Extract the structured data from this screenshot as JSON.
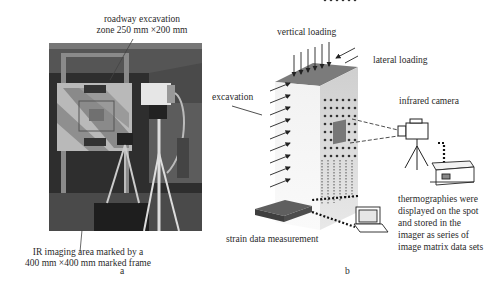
{
  "panel_a": {
    "top_caption_line1": "roadway excavation",
    "top_caption_line2": "zone 250 mm ×200 mm",
    "bottom_caption_line1": "IR imaging area marked by a",
    "bottom_caption_line2": "400 mm ×400 mm marked frame",
    "panel_label": "a"
  },
  "panel_b": {
    "vertical_loading": "vertical loading",
    "lateral_loading": "lateral loading",
    "excavation": "excavation",
    "infrared_camera": "infrared camera",
    "strain_data": "strain data measurement",
    "thermo_line1": "thermographies were",
    "thermo_line2": "displayed on the spot",
    "thermo_line3": "and stored in the",
    "thermo_line4": "imager as series of",
    "thermo_line5": "image matrix data sets",
    "panel_label": "b"
  },
  "colors": {
    "block_top": "#7a7a7a",
    "block_front": "#eeeeee",
    "block_side": "#d6d6d6",
    "photo_dark": "#3a3a3a"
  }
}
